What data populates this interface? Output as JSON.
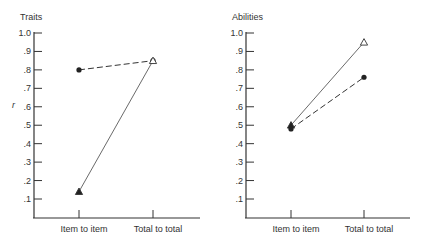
{
  "chart_data": [
    {
      "type": "line",
      "title": "Traits",
      "ylabel": "r",
      "xlabel": "",
      "categories": [
        "Item to item",
        "Total to total"
      ],
      "yticks": [
        ".1",
        ".2",
        ".3",
        ".4",
        ".5",
        ".6",
        ".7",
        ".8",
        ".9",
        "1.0"
      ],
      "ylim": [
        0,
        1.0
      ],
      "grid": false,
      "series": [
        {
          "name": "dashed (filled circle)",
          "style": "dashed",
          "markers": [
            "circle-filled",
            "circle-filled"
          ],
          "values": [
            0.8,
            0.85
          ]
        },
        {
          "name": "solid (triangle)",
          "style": "solid",
          "markers": [
            "triangle-filled",
            "triangle-open"
          ],
          "values": [
            0.14,
            0.85
          ]
        }
      ]
    },
    {
      "type": "line",
      "title": "Abilities",
      "ylabel": "",
      "xlabel": "",
      "categories": [
        "Item to item",
        "Total to total"
      ],
      "yticks": [
        ".1",
        ".2",
        ".3",
        ".4",
        ".5",
        ".6",
        ".7",
        ".8",
        ".9",
        "1.0"
      ],
      "ylim": [
        0,
        1.0
      ],
      "grid": false,
      "series": [
        {
          "name": "solid (triangle)",
          "style": "solid",
          "markers": [
            "triangle-filled",
            "triangle-open"
          ],
          "values": [
            0.5,
            0.95
          ]
        },
        {
          "name": "dashed (filled circle)",
          "style": "dashed",
          "markers": [
            "circle-filled",
            "circle-filled"
          ],
          "values": [
            0.48,
            0.76
          ]
        }
      ]
    }
  ]
}
